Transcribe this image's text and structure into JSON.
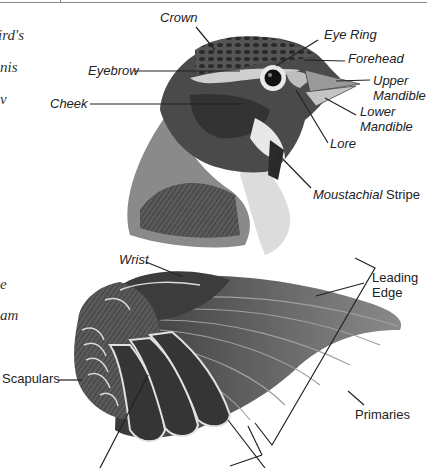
{
  "margin_text": [
    {
      "text": "ird's",
      "x": -2,
      "y": 28
    },
    {
      "text": "nis",
      "x": 0,
      "y": 60
    },
    {
      "text": "v",
      "x": 0,
      "y": 92
    },
    {
      "text": "e",
      "x": 0,
      "y": 277
    },
    {
      "text": "am",
      "x": 0,
      "y": 308
    }
  ],
  "head_labels": {
    "crown": "Crown",
    "eye_ring": "Eye Ring",
    "forehead": "Forehead",
    "upper_mandible": [
      "Upper",
      "Mandible"
    ],
    "lower_mandible": [
      "Lower",
      "Mandible"
    ],
    "lore": "Lore",
    "eyebrow": "Eyebrow",
    "cheek": "Cheek",
    "moustachial_stripe": {
      "italic": "Moustachial",
      "plain": " Stripe"
    }
  },
  "wing_labels": {
    "wrist": "Wrist",
    "leading_edge": [
      "Leading",
      "Edge"
    ],
    "scapulars": "Scapulars",
    "primaries": "Primaries"
  },
  "colors": {
    "ink": "#222222",
    "plumage_dark": "#3a3a3a",
    "plumage_mid": "#6e6e6e",
    "plumage_light": "#cfcfcf",
    "feather_edge": "#e6e6e6"
  }
}
